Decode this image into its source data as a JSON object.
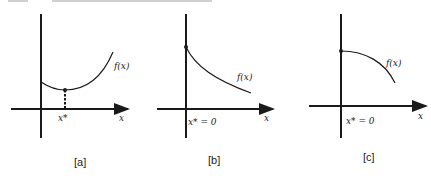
{
  "figure": {
    "panels": [
      {
        "id": "a",
        "caption": "[a]",
        "curve_label": "f(x)",
        "x_axis_label": "x",
        "optimum_label": "x*",
        "description": "convex curve with interior minimum at x*"
      },
      {
        "id": "b",
        "caption": "[b]",
        "curve_label": "f(x)",
        "x_axis_label": "x",
        "optimum_label": "x* = 0",
        "description": "decreasing convex curve, maximum at boundary x* = 0"
      },
      {
        "id": "c",
        "caption": "[c]",
        "curve_label": "f(x)",
        "x_axis_label": "x",
        "optimum_label": "x* = 0",
        "description": "decreasing concave curve, maximum at boundary x* = 0"
      }
    ],
    "colors": {
      "ink": "#1a1a1a",
      "background": "#ffffff"
    }
  }
}
